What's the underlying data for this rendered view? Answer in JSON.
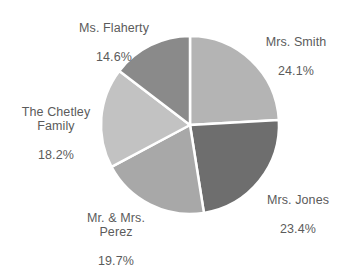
{
  "chart_data": {
    "type": "pie",
    "title": "",
    "subtitle": "",
    "xlabel": "",
    "ylabel": "",
    "legend": "none",
    "grid": false,
    "labels_inline": true,
    "start_angle_deg": 0,
    "direction": "clockwise",
    "categories": [
      "Mrs. Smith",
      "Mrs. Jones",
      "Mr. & Mrs. Perez",
      "The Chetley Family",
      "Ms. Flaherty"
    ],
    "values": [
      24.1,
      23.4,
      19.7,
      18.2,
      14.6
    ],
    "value_suffix": "%",
    "colors": [
      "#b4b4b4",
      "#6e6e6e",
      "#a8a8a8",
      "#c2c2c2",
      "#8a8a8a"
    ],
    "separator_color": "#ffffff",
    "background": "#ffffff",
    "text_color": "#5b5b5b",
    "slices": [
      {
        "name": "Mrs. Smith",
        "value": 24.1,
        "display_value": "24.1%",
        "color": "#b4b4b4",
        "label_lines": [
          "Mrs. Smith",
          "24.1%"
        ]
      },
      {
        "name": "Mrs. Jones",
        "value": 23.4,
        "display_value": "23.4%",
        "color": "#6e6e6e",
        "label_lines": [
          "Mrs. Jones",
          "23.4%"
        ]
      },
      {
        "name": "Mr. & Mrs. Perez",
        "value": 19.7,
        "display_value": "19.7%",
        "color": "#a8a8a8",
        "label_lines": [
          "Mr. & Mrs.",
          "Perez",
          "19.7%"
        ]
      },
      {
        "name": "The Chetley Family",
        "value": 18.2,
        "display_value": "18.2%",
        "color": "#c2c2c2",
        "label_lines": [
          "The Chetley",
          "Family",
          "18.2%"
        ]
      },
      {
        "name": "Ms. Flaherty",
        "value": 14.6,
        "display_value": "14.6%",
        "color": "#8a8a8a",
        "label_lines": [
          "Ms. Flaherty",
          "14.6%"
        ]
      }
    ]
  },
  "labels": {
    "smith": {
      "name": "Mrs. Smith",
      "value": "24.1%"
    },
    "jones": {
      "name": "Mrs. Jones",
      "value": "23.4%"
    },
    "perez": {
      "name": "Mr. & Mrs.\nPerez",
      "value": "19.7%"
    },
    "chetley": {
      "name": "The Chetley\nFamily",
      "value": "18.2%"
    },
    "flaherty": {
      "name": "Ms. Flaherty",
      "value": "14.6%"
    }
  }
}
